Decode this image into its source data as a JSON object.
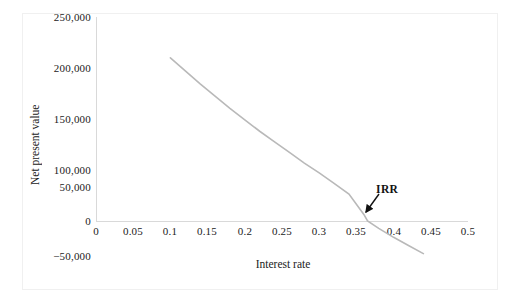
{
  "chart_data": {
    "type": "line",
    "title": "",
    "xlabel": "Interest rate",
    "ylabel": "Net present value",
    "xlim": [
      0,
      0.5
    ],
    "ylim": [
      -50000,
      250000
    ],
    "grid": false,
    "legend": "none",
    "xticks": [
      "0",
      "0.05",
      "0.1",
      "0.15",
      "0.2",
      "0.25",
      "0.3",
      "0.35",
      "0.4",
      "0.45",
      "0.5"
    ],
    "xtick_values": [
      0,
      0.05,
      0.1,
      0.15,
      0.2,
      0.25,
      0.3,
      0.35,
      0.4,
      0.45,
      0.5
    ],
    "yticks": [
      "250,000",
      "200,000",
      "150,000",
      "100,000",
      "50,000",
      "0",
      "−50,000"
    ],
    "ytick_values": [
      250000,
      200000,
      150000,
      100000,
      50000,
      0,
      -50000
    ],
    "series": [
      {
        "name": "Net present value",
        "color": "#b9b9b9",
        "x": [
          0.1,
          0.12,
          0.14,
          0.16,
          0.18,
          0.2,
          0.22,
          0.24,
          0.26,
          0.28,
          0.3,
          0.32,
          0.34,
          0.36,
          0.365,
          0.38,
          0.4,
          0.42,
          0.44
        ],
        "values": [
          200000,
          184000,
          168000,
          153000,
          138000,
          124000,
          110000,
          97000,
          84000,
          71000,
          59000,
          46000,
          33000,
          8000,
          0,
          -9000,
          -20000,
          -30000,
          -40000
        ]
      }
    ],
    "annotations": [
      {
        "text": "IRR",
        "kind": "arrow-label",
        "x": 0.365,
        "y": 0,
        "label_x": 0.373,
        "label_y": 60000
      }
    ]
  },
  "axis": {
    "x_label": "Interest rate",
    "y_label": "Net present value"
  },
  "ticks": {
    "x": [
      "0",
      "0.05",
      "0.1",
      "0.15",
      "0.2",
      "0.25",
      "0.3",
      "0.35",
      "0.4",
      "0.45",
      "0.5"
    ],
    "y": [
      "250,000",
      "200,000",
      "150,000",
      "100,000",
      "50,000",
      "0",
      "−50,000"
    ]
  },
  "annotation": {
    "irr_label": "IRR"
  },
  "colors": {
    "curve": "#b9b9b9",
    "axis": "#d9d9d9",
    "text": "#222222",
    "frame": "#f0f0f0",
    "arrow": "#111111"
  }
}
